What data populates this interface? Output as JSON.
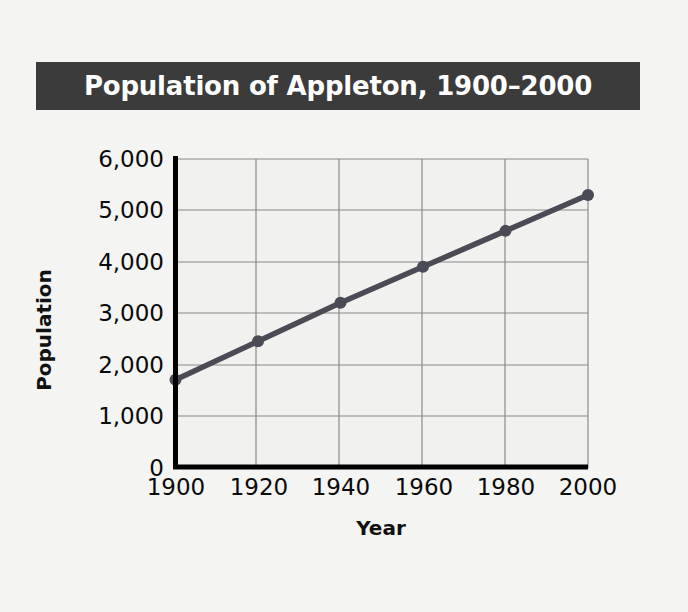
{
  "chart_data": {
    "type": "line",
    "title": "Population of Appleton, 1900–2000",
    "xlabel": "Year",
    "ylabel": "Population",
    "x": [
      1900,
      1920,
      1940,
      1960,
      1980,
      2000
    ],
    "categories": [
      "1900",
      "1920",
      "1940",
      "1960",
      "1980",
      "2000"
    ],
    "values": [
      1700,
      2450,
      3200,
      3900,
      4600,
      5300
    ],
    "series": [
      {
        "name": "Population",
        "values": [
          1700,
          2450,
          3200,
          3900,
          4600,
          5300
        ]
      }
    ],
    "xlim": [
      1900,
      2000
    ],
    "ylim": [
      0,
      6000
    ],
    "xticks": [
      "1900",
      "1920",
      "1940",
      "1960",
      "1980",
      "2000"
    ],
    "yticks": [
      "0",
      "1,000",
      "2,000",
      "3,000",
      "4,000",
      "5,000",
      "6,000"
    ],
    "ytick_values": [
      0,
      1000,
      2000,
      3000,
      4000,
      5000,
      6000
    ],
    "grid": true,
    "legend": false,
    "legend_position": "none",
    "marker": "circle",
    "annotations": []
  },
  "title_bar": {
    "text": "Population of Appleton, 1900–2000",
    "background_color": "#3b3b3b",
    "text_color": "#ffffff"
  },
  "axes": {
    "y_title": "Population",
    "x_title": "Year",
    "y_tick_labels": [
      "6,000",
      "5,000",
      "4,000",
      "3,000",
      "2,000",
      "1,000",
      "0"
    ],
    "x_tick_labels": [
      "1900",
      "1920",
      "1940",
      "1960",
      "1980",
      "2000"
    ]
  },
  "colors": {
    "page_background": "#f4f4f2",
    "plot_background": "#f1f1ef",
    "title_bar": "#3b3b3b",
    "line": "#4b4b55",
    "marker": "#4b4b55",
    "axis": "#000000",
    "gridline": "#8a8a8a",
    "text": "#0a0a0a"
  }
}
